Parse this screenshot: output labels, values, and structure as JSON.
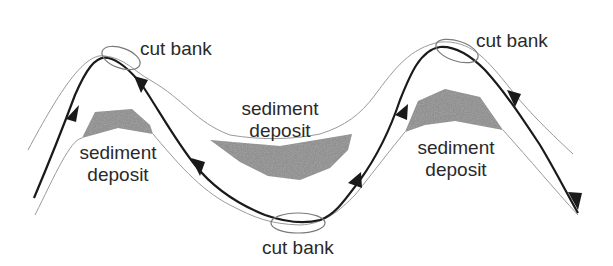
{
  "diagram": {
    "colors": {
      "background": "#ffffff",
      "flow_line": "#1a1a1a",
      "bank_line": "#9a9a9a",
      "deposit_fill": "#8c8c8c",
      "text": "#2a2a2a"
    },
    "labels": {
      "cut_bank_top_left": "cut bank",
      "cut_bank_bottom": "cut bank",
      "cut_bank_top_right": "cut bank",
      "deposit_left_line1": "sediment",
      "deposit_left_line2": "deposit",
      "deposit_middle_line1": "sediment",
      "deposit_middle_line2": "deposit",
      "deposit_right_line1": "sediment",
      "deposit_right_line2": "deposit"
    },
    "elements": {
      "flow_arrows": 7,
      "cut_bank_ellipses": 3,
      "sediment_deposits": 3
    }
  }
}
